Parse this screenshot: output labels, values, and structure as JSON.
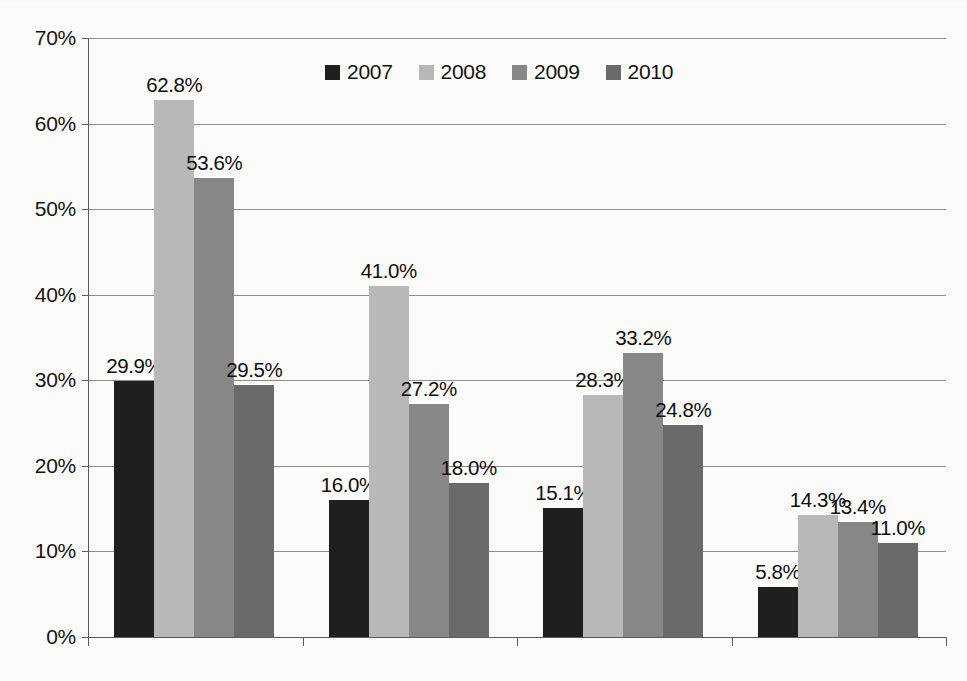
{
  "chart_data": {
    "type": "bar",
    "title": "",
    "subtitle": "",
    "xlabel": "",
    "ylabel": "",
    "categories": [
      "Crude Oil",
      "S&P 500",
      "U.S. Treasury Bond",
      "Eurodollar"
    ],
    "series": [
      {
        "name": "2007",
        "color": "#1f1f1f",
        "values": [
          29.9,
          16.0,
          15.1,
          5.8
        ]
      },
      {
        "name": "2008",
        "color": "#b8b8b8",
        "values": [
          62.8,
          41.0,
          28.3,
          14.3
        ]
      },
      {
        "name": "2009",
        "color": "#878787",
        "values": [
          53.6,
          27.2,
          33.2,
          13.4
        ]
      },
      {
        "name": "2010",
        "color": "#6a6a6a",
        "values": [
          29.5,
          18.0,
          24.8,
          11.0
        ]
      }
    ],
    "value_labels": [
      [
        "29.9%",
        "62.8%",
        "53.6%",
        "29.5%"
      ],
      [
        "16.0%",
        "41.0%",
        "27.2%",
        "18.0%"
      ],
      [
        "15.1%",
        "28.3%",
        "33.2%",
        "24.8%"
      ],
      [
        "5.8%",
        "14.3%",
        "13.4%",
        "11.0%"
      ]
    ],
    "ylim": [
      0,
      70
    ],
    "ytick_values": [
      0,
      10,
      20,
      30,
      40,
      50,
      60,
      70
    ],
    "ytick_labels": [
      "0%",
      "10%",
      "20%",
      "30%",
      "40%",
      "50%",
      "60%",
      "70%"
    ],
    "grid": true,
    "legend_position": "top-center",
    "legend_entries": [
      "2007",
      "2008",
      "2009",
      "2010"
    ],
    "value_suffix": "%",
    "bar_gap_within_group": 0,
    "background_color": "#fbfbfa",
    "gridline_color": "#8d8d8d",
    "axis_color": "#5a5a5a",
    "text_color": "#141414"
  }
}
